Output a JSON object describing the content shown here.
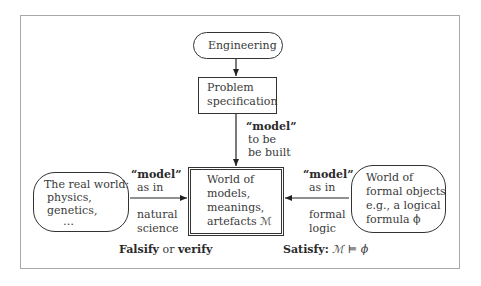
{
  "diagram": {
    "nodes": {
      "engineering": {
        "label": "Engineering"
      },
      "problem_spec": {
        "lines": [
          "Problem",
          "specification"
        ]
      },
      "world_of_models": {
        "lines": [
          "World of",
          "models,",
          "meanings,",
          "artefacts ℳ"
        ]
      },
      "real_world": {
        "lines": [
          "The real world:",
          "physics,",
          "genetics,",
          "…"
        ]
      },
      "formal_objects": {
        "lines": [
          "World of",
          "formal objects",
          "e.g., a logical",
          "formula ϕ"
        ]
      }
    },
    "edges": {
      "top_label": {
        "bold": "“model”",
        "lines": [
          "to be",
          "be built"
        ]
      },
      "left_label": {
        "bold": "“model”",
        "above": "as in",
        "below": [
          "natural",
          "science"
        ]
      },
      "right_label": {
        "bold": "“model”",
        "above": "as in",
        "below": [
          "formal",
          "logic"
        ]
      }
    },
    "captions": {
      "left": {
        "bold1": "Falsify",
        "mid": " or ",
        "bold2": "verify"
      },
      "right": {
        "bold": "Satisfy:",
        "formula": " ℳ ⊨ ϕ"
      }
    }
  }
}
